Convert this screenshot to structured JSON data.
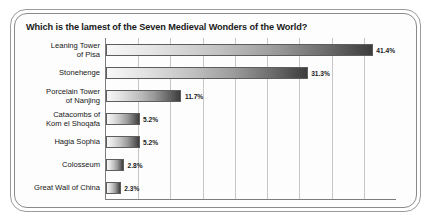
{
  "chart_data": {
    "type": "bar",
    "orientation": "horizontal",
    "title": "Which is the lamest of the Seven Medieval Wonders of the World?",
    "xlabel": "",
    "ylabel": "",
    "xlim": [
      0,
      45
    ],
    "grid": true,
    "gridlines_percent": [
      5,
      10,
      15,
      20,
      25,
      30,
      35,
      40
    ],
    "legend": null,
    "categories": [
      "Leaning Tower\nof Pisa",
      "Stonehenge",
      "Porcelain Tower\nof Nanjing",
      "Catacombs of\nKom el Shoqafa",
      "Hagia Sophia",
      "Colosseum",
      "Great Wall of China"
    ],
    "values": [
      41.4,
      31.3,
      11.7,
      5.2,
      5.2,
      2.8,
      2.3
    ],
    "value_labels": [
      "41.4%",
      "31.3%",
      "11.7%",
      "5.2%",
      "5.2%",
      "2.8%",
      "2.3%"
    ],
    "bars": [
      {
        "category_line1": "Leaning Tower",
        "category_line2": "of Pisa",
        "value": 41.4,
        "label": "41.4%"
      },
      {
        "category_line1": "Stonehenge",
        "category_line2": "",
        "value": 31.3,
        "label": "31.3%"
      },
      {
        "category_line1": "Porcelain Tower",
        "category_line2": "of Nanjing",
        "value": 11.7,
        "label": "11.7%"
      },
      {
        "category_line1": "Catacombs of",
        "category_line2": "Kom el Shoqafa",
        "value": 5.2,
        "label": "5.2%"
      },
      {
        "category_line1": "Hagia Sophia",
        "category_line2": "",
        "value": 5.2,
        "label": "5.2%"
      },
      {
        "category_line1": "Colosseum",
        "category_line2": "",
        "value": 2.8,
        "label": "2.8%"
      },
      {
        "category_line1": "Great Wall of China",
        "category_line2": "",
        "value": 2.3,
        "label": "2.3%"
      }
    ]
  },
  "colors": {
    "bar_light": "#f7f7f7",
    "bar_dark": "#3d3d3d",
    "bar_border": "#5d5d5d",
    "axis": "#7d7d7d",
    "gridline": "#c6c6c6",
    "frame_outer": "#9b9b9b",
    "frame_inner": "#8a8a8a",
    "text": "#161616",
    "background": "#ffffff"
  }
}
